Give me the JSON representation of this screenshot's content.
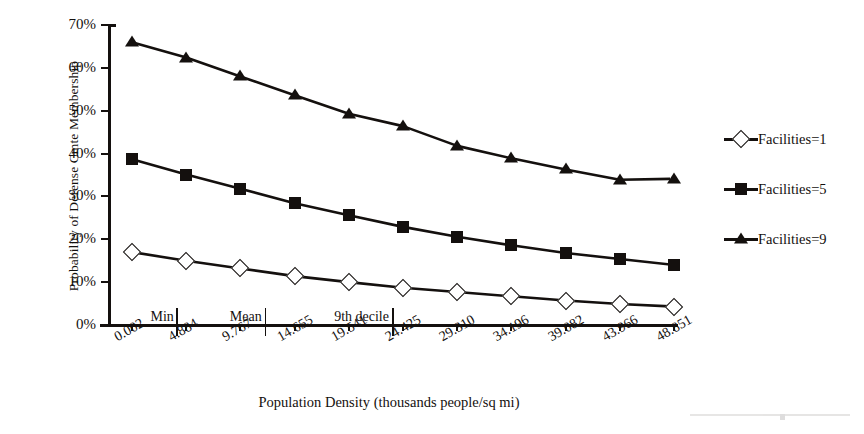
{
  "chart_data": {
    "type": "line",
    "title": "",
    "xlabel": "Population Density (thousands people/sq mi)",
    "ylabel": "Probability of Defense Cmte Membership",
    "categories": [
      "0.002",
      "4.884",
      "9.767",
      "14.655",
      "19.541",
      "24.425",
      "29.310",
      "34.196",
      "39.082",
      "43.966",
      "48.851"
    ],
    "x": [
      0.002,
      4.884,
      9.767,
      14.655,
      19.541,
      24.425,
      29.31,
      34.196,
      39.082,
      43.966,
      48.851
    ],
    "ylim": [
      0,
      70
    ],
    "xlim_index": [
      0,
      10
    ],
    "ytick_labels": [
      "0%",
      "10%",
      "20%",
      "30%",
      "40%",
      "50%",
      "60%",
      "70%"
    ],
    "ytick_values": [
      0,
      10,
      20,
      30,
      40,
      50,
      60,
      70
    ],
    "grid": false,
    "legend_position": "right",
    "series": [
      {
        "name": "Facilities=1",
        "marker": "open-diamond",
        "values": [
          17.0,
          15.0,
          13.2,
          11.4,
          10.0,
          8.7,
          7.7,
          6.7,
          5.7,
          4.9,
          4.3
        ]
      },
      {
        "name": "Facilities=5",
        "marker": "filled-square",
        "values": [
          38.7,
          35.1,
          31.8,
          28.4,
          25.6,
          22.9,
          20.6,
          18.6,
          16.8,
          15.4,
          14.0
        ]
      },
      {
        "name": "Facilities=9",
        "marker": "filled-triangle",
        "values": [
          66.0,
          62.4,
          58.0,
          53.6,
          49.3,
          46.4,
          41.8,
          38.9,
          36.3,
          33.9,
          34.1
        ]
      }
    ],
    "annotations": [
      {
        "label": "Min",
        "at_index": 0.82
      },
      {
        "label": "Mean",
        "at_index": 2.45
      },
      {
        "label": "9th decile",
        "at_index": 4.8
      }
    ],
    "colors": {
      "line": "#14100e",
      "marker_fill_open": "#ffffff",
      "marker_fill_solid": "#14100e",
      "background": "#ffffff"
    }
  },
  "legend": {
    "items": [
      {
        "label": "Facilities=1"
      },
      {
        "label": "Facilities=5"
      },
      {
        "label": "Facilities=9"
      }
    ]
  },
  "axes": {
    "y_title": "Probability of Defense Cmte Membership",
    "x_title": "Population Density (thousands people/sq mi)"
  }
}
